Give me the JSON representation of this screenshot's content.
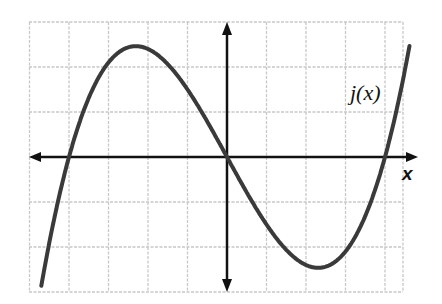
{
  "chart_data": {
    "type": "line",
    "title": "",
    "xlabel": "x",
    "ylabel": "",
    "series": [
      {
        "name": "j(x)",
        "function": "0.1*x*(x-4)*(x+4)",
        "x": [
          -4.7,
          -4,
          -3,
          -2.31,
          -1,
          0,
          1,
          2.31,
          3,
          4,
          4.6
        ],
        "values": [
          -3.3,
          0,
          2.1,
          2.46,
          1.5,
          0,
          -1.5,
          -2.46,
          -2.1,
          0,
          2.37
        ]
      }
    ],
    "roots": [
      -4,
      0,
      4
    ],
    "local_max": {
      "x": -2.31,
      "y": 2.46
    },
    "local_min": {
      "x": 2.31,
      "y": -2.46
    },
    "xlim": [
      -5,
      4.5
    ],
    "ylim": [
      -3,
      3
    ],
    "grid": true,
    "tick_labels_shown": false,
    "legend": "none",
    "annotations": [
      "j(x)",
      "x"
    ],
    "colors": {
      "curve": "#3a3a3a",
      "axes": "#111111",
      "grid": "#c8c8c8"
    }
  },
  "labels": {
    "function_label": "j(x)",
    "x_axis_label": "x"
  }
}
